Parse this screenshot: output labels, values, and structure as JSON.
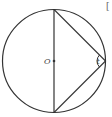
{
  "diagram": {
    "type": "circle-inscribed-triangle",
    "labels": {
      "center": "O",
      "angle": "t",
      "corner_mark": "["
    },
    "colors": {
      "stroke": "#333333",
      "label": "#444444"
    }
  }
}
